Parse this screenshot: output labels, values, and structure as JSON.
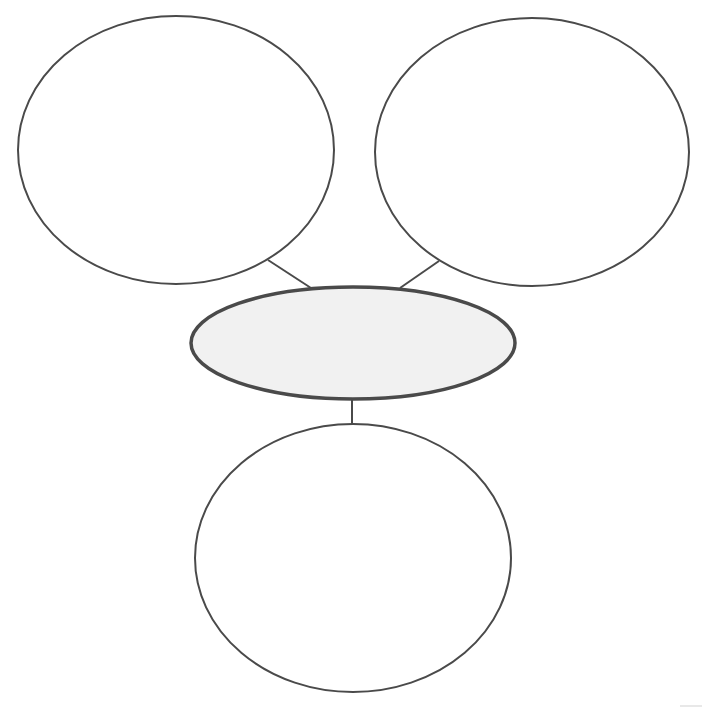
{
  "diagram": {
    "type": "concept-map",
    "stroke_color": "#4a4a4a",
    "center_fill": "#f1f1f1",
    "nodes": [
      {
        "id": "top-left",
        "label": "",
        "cx": 176,
        "cy": 150,
        "rx": 158,
        "ry": 134
      },
      {
        "id": "top-right",
        "label": "",
        "cx": 532,
        "cy": 152,
        "rx": 157,
        "ry": 134
      },
      {
        "id": "center",
        "label": "",
        "cx": 353,
        "cy": 343,
        "rx": 163,
        "ry": 57
      },
      {
        "id": "bottom",
        "label": "",
        "cx": 353,
        "cy": 558,
        "rx": 158,
        "ry": 134
      }
    ],
    "edges": [
      {
        "from": "top-left",
        "to": "center"
      },
      {
        "from": "top-right",
        "to": "center"
      },
      {
        "from": "center",
        "to": "bottom"
      }
    ]
  }
}
